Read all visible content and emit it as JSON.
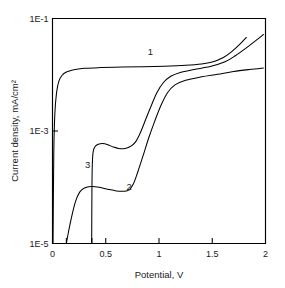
{
  "chart_data": {
    "type": "line",
    "title": "",
    "subtitle": "",
    "xlabel": "Potential, V",
    "ylabel": "Current density, mA/cm²",
    "xlim": [
      0,
      2
    ],
    "ylim": [
      1e-05,
      0.1
    ],
    "yscale": "log",
    "xscale": "linear",
    "grid": false,
    "legend_position": "inline-annotations",
    "xticks": [
      0,
      0.5,
      1,
      1.5,
      2
    ],
    "xtick_labels": [
      "0",
      "0.5",
      "1",
      "1.5",
      "2"
    ],
    "xticks_minor": [
      0.13,
      0.37
    ],
    "yticks": [
      0.1,
      0.001,
      1e-05
    ],
    "ytick_labels": [
      "1E-1",
      "1E-3",
      "1E-5"
    ],
    "annotations": [
      {
        "text": "1",
        "x": 0.92,
        "y": 0.022
      },
      {
        "text": "3",
        "x": 0.33,
        "y": 0.00022
      },
      {
        "text": "2",
        "x": 0.72,
        "y": 9e-05
      }
    ],
    "series": [
      {
        "name": "1",
        "label": "1",
        "color": "#000000",
        "points": [
          [
            0.005,
            1e-05
          ],
          [
            0.012,
            0.0004
          ],
          [
            0.022,
            0.002
          ],
          [
            0.038,
            0.0048
          ],
          [
            0.06,
            0.0077
          ],
          [
            0.09,
            0.0098
          ],
          [
            0.13,
            0.0112
          ],
          [
            0.19,
            0.0122
          ],
          [
            0.3,
            0.013
          ],
          [
            0.45,
            0.0134
          ],
          [
            0.65,
            0.0137
          ],
          [
            0.85,
            0.0139
          ],
          [
            1.05,
            0.0142
          ],
          [
            1.25,
            0.0147
          ],
          [
            1.4,
            0.0155
          ],
          [
            1.5,
            0.0168
          ],
          [
            1.6,
            0.02
          ],
          [
            1.68,
            0.0255
          ],
          [
            1.76,
            0.035
          ],
          [
            1.82,
            0.046
          ]
        ]
      },
      {
        "name": "2",
        "label": "2",
        "color": "#000000",
        "points": [
          [
            0.13,
            1e-05
          ],
          [
            0.15,
            1.6e-05
          ],
          [
            0.18,
            3e-05
          ],
          [
            0.215,
            5.5e-05
          ],
          [
            0.255,
            8.2e-05
          ],
          [
            0.3,
            9.7e-05
          ],
          [
            0.36,
            0.000103
          ],
          [
            0.44,
            0.0001
          ],
          [
            0.52,
            9.2e-05
          ],
          [
            0.6,
            8.6e-05
          ],
          [
            0.67,
            8.5e-05
          ],
          [
            0.72,
            9e-05
          ],
          [
            0.76,
            0.000115
          ],
          [
            0.8,
            0.000185
          ],
          [
            0.85,
            0.00036
          ],
          [
            0.9,
            0.00072
          ],
          [
            0.96,
            0.0015
          ],
          [
            1.02,
            0.0029
          ],
          [
            1.08,
            0.0048
          ],
          [
            1.15,
            0.0066
          ],
          [
            1.25,
            0.008
          ],
          [
            1.4,
            0.0092
          ],
          [
            1.55,
            0.0102
          ],
          [
            1.7,
            0.0114
          ],
          [
            1.85,
            0.0124
          ],
          [
            1.98,
            0.0132
          ]
        ]
      },
      {
        "name": "3",
        "label": "3",
        "color": "#000000",
        "points": [
          [
            0.368,
            1e-05
          ],
          [
            0.37,
            8e-05
          ],
          [
            0.374,
            0.00026
          ],
          [
            0.382,
            0.00043
          ],
          [
            0.4,
            0.00053
          ],
          [
            0.43,
            0.00058
          ],
          [
            0.47,
            0.0006
          ],
          [
            0.52,
            0.00057
          ],
          [
            0.57,
            0.00052
          ],
          [
            0.62,
            0.00049
          ],
          [
            0.68,
            0.00049
          ],
          [
            0.73,
            0.00053
          ],
          [
            0.78,
            0.00064
          ],
          [
            0.83,
            0.00098
          ],
          [
            0.88,
            0.0017
          ],
          [
            0.93,
            0.0029
          ],
          [
            0.98,
            0.0048
          ],
          [
            1.04,
            0.0072
          ],
          [
            1.11,
            0.0094
          ],
          [
            1.2,
            0.011
          ],
          [
            1.33,
            0.0124
          ],
          [
            1.48,
            0.014
          ],
          [
            1.62,
            0.017
          ],
          [
            1.72,
            0.022
          ],
          [
            1.82,
            0.03
          ],
          [
            1.92,
            0.042
          ],
          [
            1.98,
            0.052
          ]
        ]
      }
    ]
  }
}
